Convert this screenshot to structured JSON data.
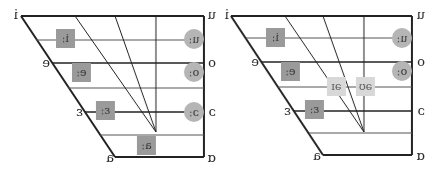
{
  "figure": {
    "orientation": "mirrored-horizontal",
    "charts": [
      {
        "id": "left",
        "corners": {
          "front_close": "i",
          "front_closemid": "e",
          "front_openmid": "ɛ",
          "front_open": "a",
          "back_close": "u",
          "back_closemid": "o",
          "back_openmid": "ɔ",
          "back_open": "ɑ"
        },
        "front_vowels": [
          "iː",
          "eː",
          "ɛː"
        ],
        "central_open": "aː",
        "back_vowels": [
          "uː",
          "oː",
          "ɔː"
        ]
      },
      {
        "id": "right",
        "corners": {
          "front_close": "i",
          "front_closemid": "e",
          "front_openmid": "ɛ",
          "front_open": "a",
          "back_close": "u",
          "back_closemid": "o",
          "back_openmid": "ɔ",
          "back_open": "ɑ"
        },
        "front_vowels": [
          "iː",
          "eː",
          "ɛː"
        ],
        "back_vowels": [
          "uː",
          "oː"
        ],
        "diphthongs": [
          "əɪ",
          "əʊ"
        ]
      }
    ],
    "colors": {
      "front_box": "#9a9a9a",
      "back_circle": "#b5b5b5",
      "diphthong_box": "#d8d8d8",
      "lines": "#222222"
    }
  }
}
